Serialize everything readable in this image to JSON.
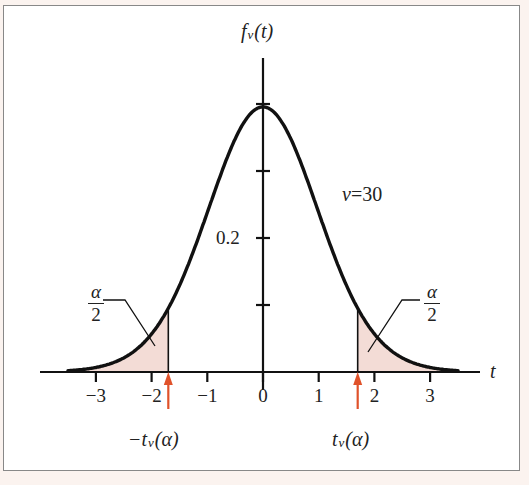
{
  "chart_data": {
    "type": "line",
    "title": "",
    "xlabel": "t",
    "ylabel": "f_ν(t)",
    "distribution": "Student t density",
    "nu_label": "ν=30",
    "xlim": [
      -3.8,
      4.0
    ],
    "ylim": [
      0,
      0.42
    ],
    "x_ticks": [
      -3,
      -2,
      -1,
      0,
      1,
      2,
      3
    ],
    "x_tick_labels": [
      "−3",
      "−2",
      "−1",
      "0",
      "1",
      "2",
      "3"
    ],
    "y_ticks": [
      0.1,
      0.2,
      0.3,
      0.4
    ],
    "y_tick_labels": [
      "",
      "0.2",
      "",
      ""
    ],
    "critical_values": {
      "lower": -1.7,
      "upper": 1.7
    },
    "critical_labels": {
      "lower": "−t",
      "upper": "t",
      "sub": "ν",
      "arg": "(α)"
    },
    "tail_labels": {
      "numerator": "α",
      "denominator": "2"
    },
    "shaded_color": "#f3dcd6",
    "arrow_color": "#e0522a",
    "curve_color": "#111111",
    "grid": false
  },
  "labels": {
    "y_axis_f": "f",
    "y_axis_sub": "ν",
    "y_axis_arg": "(t)",
    "x_axis": "t",
    "nu": "ν = 30",
    "y_02": "0.2",
    "lower_minus": "−t",
    "upper_t": "t",
    "sub": "ν",
    "arg": "(α)",
    "alpha": "α",
    "two": "2"
  }
}
